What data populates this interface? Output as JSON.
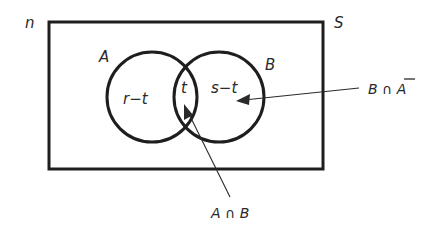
{
  "diagram": {
    "type": "venn",
    "universe": {
      "name_label": "S",
      "count_label": "n"
    },
    "sets": [
      {
        "name": "A",
        "region_label": "r−t"
      },
      {
        "name": "B",
        "region_label": "s−t"
      }
    ],
    "intersection": {
      "region_label": "t"
    },
    "annotations": [
      {
        "text": "B ∩ A",
        "overline_char": "A",
        "points_to": "B only region"
      },
      {
        "text": "A ∩ B",
        "points_to": "intersection region"
      }
    ]
  },
  "labels": {
    "n": "n",
    "S": "S",
    "A": "A",
    "B": "B",
    "r_minus_t": "r−t",
    "t": "t",
    "s_minus_t": "s−t",
    "b_and_not_a_prefix": "B ∩ ",
    "b_and_not_a_complement": "A",
    "a_and_b": "A ∩ B"
  },
  "colors": {
    "ink": "#1e1e1e",
    "background": "#ffffff"
  }
}
